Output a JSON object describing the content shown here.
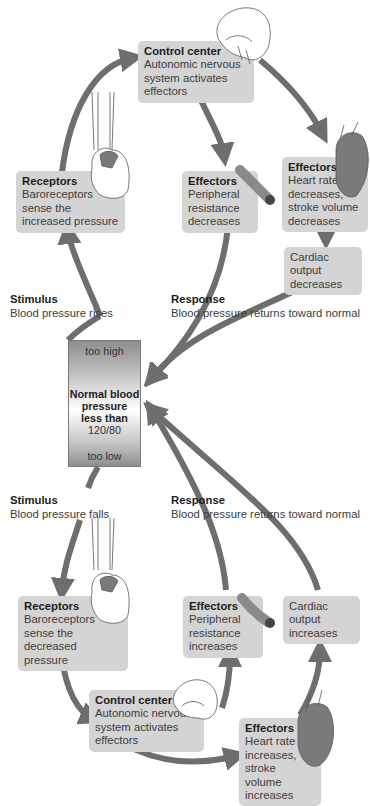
{
  "diagram": {
    "center": {
      "top_label": "too high",
      "title": "Normal blood\npressure\nless than",
      "value": "120/80",
      "bottom_label": "too low"
    },
    "upper_loop": {
      "stimulus": {
        "title": "Stimulus",
        "text": "Blood pressure rises"
      },
      "receptors": {
        "title": "Receptors",
        "text": "Baroreceptors\nsense the\nincreased pressure"
      },
      "control_center": {
        "title": "Control center",
        "text": "Autonomic nervous\nsystem activates\neffectors"
      },
      "effectors_vessel": {
        "title": "Effectors",
        "text": "Peripheral\nresistance\ndecreases"
      },
      "effectors_heart": {
        "title": "Effectors",
        "text": "Heart rate\ndecreases,\nstroke volume\ndecreases"
      },
      "cardiac_output": {
        "text": "Cardiac output\ndecreases"
      },
      "response": {
        "title": "Response",
        "text": "Blood pressure returns toward normal"
      }
    },
    "lower_loop": {
      "stimulus": {
        "title": "Stimulus",
        "text": "Blood pressure falls"
      },
      "receptors": {
        "title": "Receptors",
        "text": "Baroreceptors\nsense the\ndecreased pressure"
      },
      "control_center": {
        "title": "Control center",
        "text": "Autonomic nervous\nsystem activates\neffectors"
      },
      "effectors_vessel": {
        "title": "Effectors",
        "text": "Peripheral\nresistance\nincreases"
      },
      "effectors_heart": {
        "title": "Effectors",
        "text": "Heart rate\nincreases,\nstroke volume\nincreases"
      },
      "cardiac_output": {
        "text": "Cardiac output\nincreases"
      },
      "response": {
        "title": "Response",
        "text": "Blood pressure returns toward normal"
      }
    },
    "icons": [
      "brain-icon",
      "heart-icon",
      "blood-vessel-icon"
    ],
    "colors": {
      "arrow": "#6e6e6e",
      "box": "#d4d4d4",
      "heart_fill": "#7a7a7a",
      "vessel_fill": "#8a8a8a"
    }
  }
}
